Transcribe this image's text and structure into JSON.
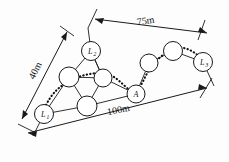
{
  "figure": {
    "background_color": "#fdfdfd",
    "line_color": "#1a1a1a",
    "route_color": "#111111"
  },
  "dimensions": [
    {
      "id": "left",
      "label": "40m",
      "value": 40,
      "unit": "m",
      "orientation": "diagonal-left",
      "rotation_deg": -62
    },
    {
      "id": "top",
      "label": "75m",
      "value": 75,
      "unit": "m",
      "orientation": "diagonal-top",
      "rotation_deg": -8
    },
    {
      "id": "bottom",
      "label": "100m",
      "value": 100,
      "unit": "m",
      "orientation": "diagonal-bottom",
      "rotation_deg": -11
    }
  ],
  "nodes": [
    {
      "id": "L1",
      "label": "L",
      "sub": "1",
      "x": 44,
      "y": 114,
      "r": 9.5,
      "type": "anchor"
    },
    {
      "id": "L2",
      "label": "L",
      "sub": "2",
      "x": 91,
      "y": 51,
      "r": 9.5,
      "type": "anchor"
    },
    {
      "id": "L3",
      "label": "L",
      "sub": "3",
      "x": 203,
      "y": 62,
      "r": 9.5,
      "type": "anchor"
    },
    {
      "id": "A",
      "label": "A",
      "sub": "",
      "x": 136,
      "y": 94,
      "r": 9.0,
      "type": "target"
    },
    {
      "id": "n1",
      "label": "",
      "sub": "",
      "x": 69,
      "y": 77,
      "r": 10.0,
      "type": "sensor"
    },
    {
      "id": "n2",
      "label": "",
      "sub": "",
      "x": 103,
      "y": 78,
      "r": 9.0,
      "type": "sensor"
    },
    {
      "id": "n3",
      "label": "",
      "sub": "",
      "x": 87,
      "y": 106,
      "r": 10.0,
      "type": "sensor"
    },
    {
      "id": "n4",
      "label": "",
      "sub": "",
      "x": 149,
      "y": 63,
      "r": 9.0,
      "type": "sensor"
    },
    {
      "id": "n5",
      "label": "",
      "sub": "",
      "x": 173,
      "y": 51,
      "r": 9.5,
      "type": "sensor"
    }
  ],
  "edges": [
    {
      "from": "L1",
      "to": "n1"
    },
    {
      "from": "L1",
      "to": "n3"
    },
    {
      "from": "n1",
      "to": "L2"
    },
    {
      "from": "n1",
      "to": "n2"
    },
    {
      "from": "n1",
      "to": "n3"
    },
    {
      "from": "n2",
      "to": "L2"
    },
    {
      "from": "n2",
      "to": "n3"
    },
    {
      "from": "n2",
      "to": "A"
    },
    {
      "from": "n3",
      "to": "A"
    },
    {
      "from": "A",
      "to": "n4"
    },
    {
      "from": "n4",
      "to": "n5"
    },
    {
      "from": "n5",
      "to": "L3"
    },
    {
      "from": "L2",
      "to": "n2"
    }
  ],
  "route": {
    "name": "dotted-routing-path",
    "style": "dotted",
    "from": "L1",
    "to": "L3",
    "waypoints": [
      "L1",
      "n1",
      "n2",
      "A",
      "n4",
      "n5",
      "L3"
    ]
  }
}
